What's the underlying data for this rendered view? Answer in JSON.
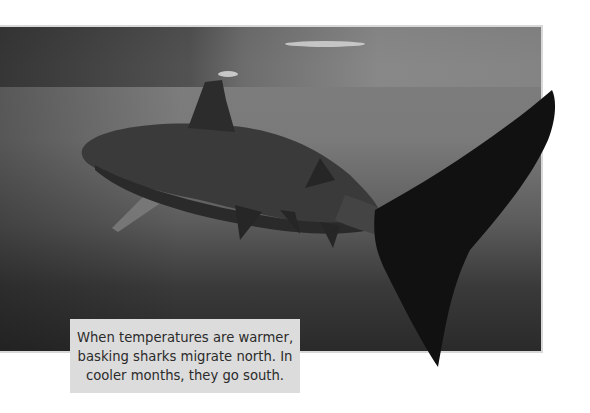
{
  "figure": {
    "caption": {
      "lines": [
        "When temperatures are warmer,",
        "basking sharks migrate north. In",
        "cooler months, they go south."
      ]
    },
    "colors": {
      "caption_bg": "#dcdcdc",
      "caption_text": "#2b2b2b",
      "photo_border": "#d8d8d8",
      "shark": "#151515"
    }
  }
}
